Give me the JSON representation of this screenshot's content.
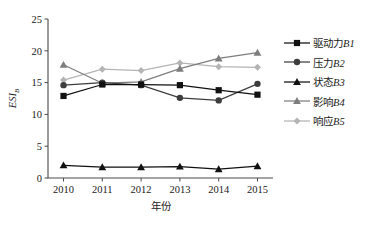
{
  "chart_data": {
    "type": "line",
    "title": "",
    "xlabel": "年份",
    "ylabel": "ESI_B",
    "ylabel_main": "ESI",
    "ylabel_subscript": "B",
    "x": [
      2010,
      2011,
      2012,
      2013,
      2014,
      2015
    ],
    "categories": [
      "2010",
      "2011",
      "2012",
      "2013",
      "2014",
      "2015"
    ],
    "xlim": [
      2009.6,
      2015.4
    ],
    "ylim": [
      0,
      25
    ],
    "yticks": [
      0,
      5,
      10,
      15,
      20,
      25
    ],
    "ytick_labels": [
      "0",
      "5",
      "10",
      "15",
      "20",
      "25"
    ],
    "grid": false,
    "legend_position": "right",
    "series": [
      {
        "name": "驱动力B1",
        "label_cn": "驱动力",
        "label_code": "B1",
        "marker": "square",
        "color": "#111111",
        "values": [
          12.9,
          14.7,
          14.7,
          14.6,
          13.8,
          13.1
        ]
      },
      {
        "name": "压力B2",
        "label_cn": "压力",
        "label_code": "B2",
        "marker": "circle",
        "color": "#3d3d3d",
        "values": [
          14.6,
          15.0,
          14.6,
          12.6,
          12.2,
          14.8
        ]
      },
      {
        "name": "状态B3",
        "label_cn": "状态",
        "label_code": "B3",
        "marker": "triangle",
        "color": "#111111",
        "values": [
          2.0,
          1.7,
          1.7,
          1.8,
          1.4,
          1.85
        ]
      },
      {
        "name": "影响B4",
        "label_cn": "影响",
        "label_code": "B4",
        "marker": "triangle",
        "color": "#7d7d7d",
        "values": [
          17.8,
          14.9,
          15.1,
          17.2,
          18.8,
          19.7
        ]
      },
      {
        "name": "响应B5",
        "label_cn": "响应",
        "label_code": "B5",
        "marker": "diamond",
        "color": "#b4b4b4",
        "values": [
          15.4,
          17.1,
          16.9,
          18.1,
          17.5,
          17.4
        ]
      }
    ]
  }
}
